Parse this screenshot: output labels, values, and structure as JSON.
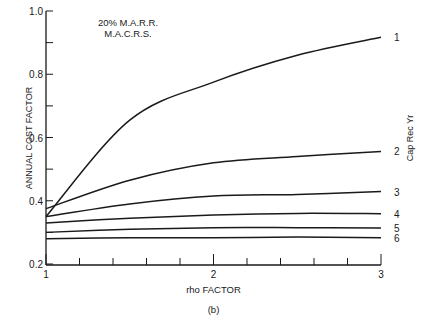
{
  "chart_data": {
    "type": "line",
    "title": "",
    "annotation": [
      "20% M.A.R.R.",
      "M.A.C.R.S."
    ],
    "xlabel": "rho FACTOR",
    "ylabel": "ANNUAL COST FACTOR",
    "right_label": "Cap Rec Yr",
    "caption": "(b)",
    "xlim": [
      1,
      3
    ],
    "ylim": [
      0.2,
      1.0
    ],
    "x_ticks_major": [
      1,
      2,
      3
    ],
    "x_tick_labels": [
      "1",
      "2",
      "3"
    ],
    "y_ticks_major": [
      0.2,
      0.4,
      0.6,
      0.8,
      1.0
    ],
    "y_tick_labels": [
      "0.2",
      "0.4",
      "0.6",
      "0.8",
      "1.0"
    ],
    "grid": false,
    "legend_position": "inline-right",
    "x": [
      1.0,
      1.5,
      2.0,
      2.5,
      3.0
    ],
    "series": [
      {
        "name": "1",
        "values": [
          0.35,
          0.655,
          0.775,
          0.86,
          0.917
        ]
      },
      {
        "name": "2",
        "values": [
          0.375,
          0.465,
          0.52,
          0.54,
          0.556
        ]
      },
      {
        "name": "3",
        "values": [
          0.35,
          0.39,
          0.415,
          0.42,
          0.429
        ]
      },
      {
        "name": "4",
        "values": [
          0.33,
          0.345,
          0.355,
          0.36,
          0.359
        ]
      },
      {
        "name": "5",
        "values": [
          0.3,
          0.31,
          0.315,
          0.315,
          0.314
        ]
      },
      {
        "name": "6",
        "values": [
          0.28,
          0.283,
          0.283,
          0.285,
          0.283
        ]
      }
    ]
  }
}
